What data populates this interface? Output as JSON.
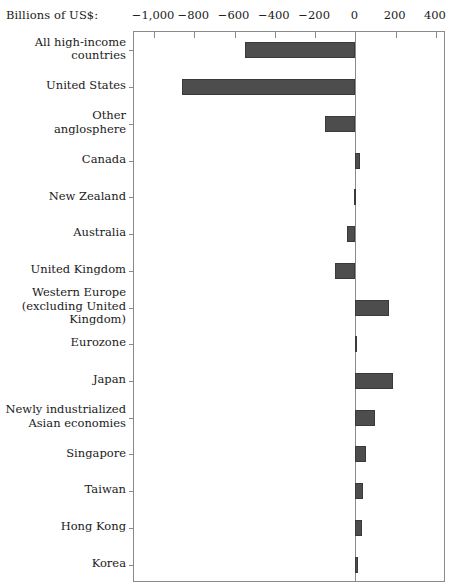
{
  "chart_data": {
    "type": "bar",
    "orientation": "horizontal",
    "title": "",
    "xlabel": "Billions of US$:",
    "ylabel": "",
    "xlim": [
      -1100,
      450
    ],
    "xticks": [
      -1000,
      -800,
      -600,
      -400,
      -200,
      0,
      200,
      400
    ],
    "xtick_labels": [
      "−1,000",
      "−800",
      "−600",
      "−400",
      "−200",
      "0",
      "200",
      "400"
    ],
    "grid": false,
    "legend": "none",
    "axis_position": "top",
    "bar_color": "#4d4d4d",
    "categories": [
      "All high-income\ncountries",
      "United States",
      "Other\nanglosphere",
      "Canada",
      "New Zealand",
      "Australia",
      "United Kingdom",
      "Western Europe\n(excluding United\nKingdom)",
      "Eurozone",
      "Japan",
      "Newly industrialized\nAsian economies",
      "Singapore",
      "Taiwan",
      "Hong Kong",
      "Korea"
    ],
    "values": [
      -550,
      -860,
      -150,
      25,
      -5,
      -40,
      -100,
      165,
      5,
      185,
      95,
      55,
      40,
      35,
      12
    ]
  }
}
